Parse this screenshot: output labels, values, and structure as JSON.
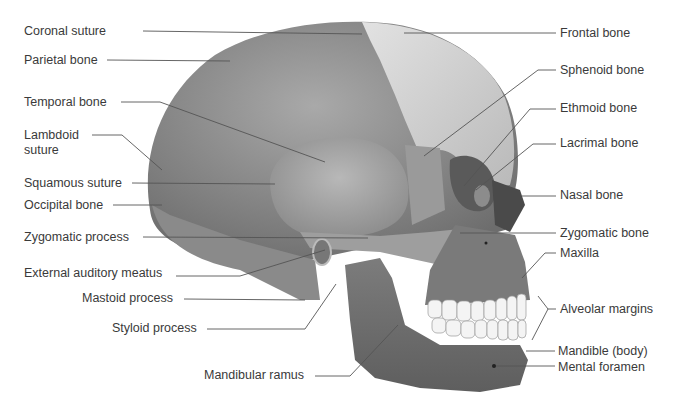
{
  "diagram": {
    "type": "anatomical-illustration",
    "colors": {
      "background": "#ffffff",
      "label_text": "#3a3a3a",
      "leader_line": "#555555",
      "cranium": "#8a8a8a",
      "frontal": "#d2d2d2",
      "temporal": "#a8a8a8",
      "face": "#7a7a7a",
      "mandible": "#6e6e6e",
      "teeth": "#f4f4f4"
    },
    "labels_left": [
      {
        "id": "coronal-suture",
        "text": "Coronal suture",
        "x": 24,
        "y": 24,
        "line": [
          [
            143,
            31
          ],
          [
            362,
            34
          ]
        ]
      },
      {
        "id": "parietal-bone",
        "text": "Parietal bone",
        "x": 24,
        "y": 53,
        "line": [
          [
            107,
            60
          ],
          [
            230,
            61
          ]
        ]
      },
      {
        "id": "temporal-bone",
        "text": "Temporal bone",
        "x": 24,
        "y": 95,
        "line": [
          [
            121,
            102
          ],
          [
            160,
            102
          ],
          [
            325,
            162
          ]
        ]
      },
      {
        "id": "lambdoid-suture",
        "text": "Lambdoid\nsuture",
        "x": 24,
        "y": 128,
        "line": [
          [
            92,
            135
          ],
          [
            122,
            135
          ],
          [
            162,
            170
          ]
        ]
      },
      {
        "id": "squamous-suture",
        "text": "Squamous suture",
        "x": 24,
        "y": 176,
        "line": [
          [
            132,
            183
          ],
          [
            275,
            184
          ]
        ]
      },
      {
        "id": "occipital-bone",
        "text": "Occipital bone",
        "x": 24,
        "y": 198,
        "line": [
          [
            113,
            205
          ],
          [
            162,
            205
          ]
        ]
      },
      {
        "id": "zygomatic-process",
        "text": "Zygomatic process",
        "x": 24,
        "y": 230,
        "line": [
          [
            143,
            237
          ],
          [
            368,
            238
          ]
        ]
      },
      {
        "id": "external-auditory-meatus",
        "text": "External auditory meatus",
        "x": 24,
        "y": 266,
        "line": [
          [
            176,
            276
          ],
          [
            240,
            276
          ],
          [
            325,
            250
          ]
        ]
      },
      {
        "id": "mastoid-process",
        "text": "Mastoid process",
        "x": 82,
        "y": 291,
        "line": [
          [
            184,
            299
          ],
          [
            305,
            300
          ]
        ]
      },
      {
        "id": "styloid-process",
        "text": "Styloid process",
        "x": 112,
        "y": 321,
        "line": [
          [
            207,
            329
          ],
          [
            305,
            329
          ],
          [
            336,
            284
          ]
        ]
      },
      {
        "id": "mandibular-ramus",
        "text": "Mandibular ramus",
        "x": 204,
        "y": 368,
        "line": [
          [
            315,
            376
          ],
          [
            350,
            376
          ],
          [
            398,
            325
          ]
        ]
      }
    ],
    "labels_right": [
      {
        "id": "frontal-bone",
        "text": "Frontal bone",
        "x": 560,
        "y": 26,
        "line": [
          [
            404,
            33
          ],
          [
            556,
            33
          ]
        ]
      },
      {
        "id": "sphenoid-bone",
        "text": "Sphenoid bone",
        "x": 560,
        "y": 63,
        "line": [
          [
            556,
            70
          ],
          [
            538,
            70
          ],
          [
            424,
            156
          ]
        ]
      },
      {
        "id": "ethmoid-bone",
        "text": "Ethmoid bone",
        "x": 560,
        "y": 101,
        "line": [
          [
            556,
            109
          ],
          [
            530,
            109
          ],
          [
            464,
            186
          ]
        ]
      },
      {
        "id": "lacrimal-bone",
        "text": "Lacrimal bone",
        "x": 560,
        "y": 136,
        "line": [
          [
            556,
            144
          ],
          [
            533,
            144
          ],
          [
            476,
            190
          ]
        ]
      },
      {
        "id": "nasal-bone",
        "text": "Nasal bone",
        "x": 560,
        "y": 188,
        "line": [
          [
            522,
            196
          ],
          [
            556,
            196
          ]
        ]
      },
      {
        "id": "zygomatic-bone",
        "text": "Zygomatic bone",
        "x": 560,
        "y": 226,
        "line": [
          [
            460,
            233
          ],
          [
            556,
            233
          ]
        ]
      },
      {
        "id": "maxilla",
        "text": "Maxilla",
        "x": 560,
        "y": 246,
        "line": [
          [
            556,
            253
          ],
          [
            545,
            253
          ],
          [
            522,
            278
          ]
        ]
      },
      {
        "id": "alveolar-margins",
        "text": "Alveolar margins",
        "x": 560,
        "y": 302,
        "line": [
          [
            556,
            309
          ],
          [
            548,
            309
          ],
          [
            538,
            296
          ]
        ],
        "line2": [
          [
            548,
            309
          ],
          [
            532,
            340
          ]
        ]
      },
      {
        "id": "mandible-body",
        "text": "Mandible (body)",
        "x": 558,
        "y": 344,
        "line": [
          [
            526,
            351
          ],
          [
            555,
            351
          ]
        ]
      },
      {
        "id": "mental-foramen",
        "text": "Mental foramen",
        "x": 558,
        "y": 360,
        "line": [
          [
            496,
            366
          ],
          [
            555,
            366
          ]
        ]
      }
    ]
  }
}
